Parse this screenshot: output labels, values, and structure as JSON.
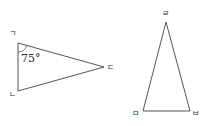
{
  "figure": {
    "stroke_color": "#555555",
    "triangle_1": {
      "vertices": [
        {
          "label": "ㄱ",
          "x": 18,
          "y": 43,
          "lx": 9,
          "ly": 36
        },
        {
          "label": "ㄴ",
          "x": 18,
          "y": 91,
          "lx": 9,
          "ly": 97
        },
        {
          "label": "ㄷ",
          "x": 104,
          "y": 67,
          "lx": 107,
          "ly": 70
        }
      ],
      "angle_label": "75°",
      "angle_at": "ㄱ"
    },
    "triangle_2": {
      "vertices": [
        {
          "label": "ㄹ",
          "x": 166,
          "y": 22,
          "lx": 162,
          "ly": 16
        },
        {
          "label": "ㅁ",
          "x": 143,
          "y": 111,
          "lx": 132,
          "ly": 116
        },
        {
          "label": "ㅂ",
          "x": 190,
          "y": 111,
          "lx": 192,
          "ly": 116
        }
      ]
    }
  }
}
